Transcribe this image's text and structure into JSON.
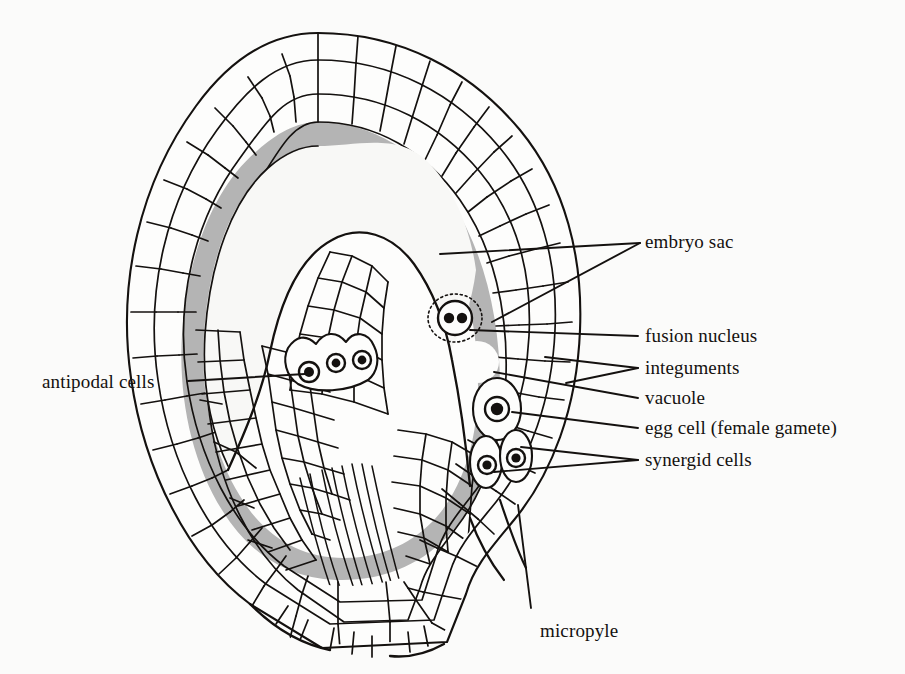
{
  "figure": {
    "background_color": "#fbfbfa",
    "ink_color": "#14110f",
    "cytoplasm_color": "#b4b4b4",
    "embryo_sac_fill": "#f7f7f5"
  },
  "labels": [
    {
      "id": "embryo-sac",
      "text": "embryo sac",
      "x": 645,
      "y": 240
    },
    {
      "id": "fusion-nucleus",
      "text": "fusion nucleus",
      "x": 645,
      "y": 327
    },
    {
      "id": "integuments",
      "text": "integuments",
      "x": 645,
      "y": 359
    },
    {
      "id": "vacuole",
      "text": "vacuole",
      "x": 645,
      "y": 389
    },
    {
      "id": "egg-cell",
      "text": "egg cell (female gamete)",
      "x": 645,
      "y": 419
    },
    {
      "id": "synergid-cells",
      "text": "synergid cells",
      "x": 645,
      "y": 451
    },
    {
      "id": "antipodal-cells",
      "text": "antipodal cells",
      "x": 42,
      "y": 386
    },
    {
      "id": "micropyle",
      "text": "micropyle",
      "x": 540,
      "y": 622
    }
  ],
  "leaders": [
    {
      "id": "embryo-sac-1",
      "from": [
        640,
        243
      ],
      "to": [
        440,
        254
      ]
    },
    {
      "id": "embryo-sac-2",
      "from": [
        640,
        243
      ],
      "to": [
        492,
        322
      ]
    },
    {
      "id": "fusion-nucleus-1",
      "from": [
        638,
        336
      ],
      "to": [
        470,
        330
      ]
    },
    {
      "id": "integuments-1",
      "from": [
        638,
        368
      ],
      "to": [
        545,
        357
      ]
    },
    {
      "id": "integuments-2",
      "from": [
        638,
        368
      ],
      "to": [
        566,
        383
      ]
    },
    {
      "id": "vacuole-1",
      "from": [
        638,
        398
      ],
      "to": [
        494,
        372
      ]
    },
    {
      "id": "egg-cell-1",
      "from": [
        638,
        428
      ],
      "to": [
        512,
        412
      ]
    },
    {
      "id": "synergid-1",
      "from": [
        638,
        460
      ],
      "to": [
        521,
        447
      ]
    },
    {
      "id": "synergid-2",
      "from": [
        638,
        460
      ],
      "to": [
        494,
        472
      ]
    },
    {
      "id": "antipodal-1",
      "from": [
        188,
        381
      ],
      "to": [
        305,
        374
      ]
    },
    {
      "id": "micropyle-1",
      "from": [
        531,
        608
      ],
      "to": [
        518,
        505
      ]
    }
  ],
  "structures": {
    "fusion_nucleus": {
      "cx": 455,
      "cy": 318,
      "r": 17,
      "nuclei": [
        [
          449,
          318
        ],
        [
          462,
          318
        ]
      ],
      "halo_r": 26
    },
    "vacuole": {
      "cx": 477,
      "cy": 362,
      "rx": 21,
      "ry": 20
    },
    "egg_cell": {
      "cx": 497,
      "cy": 409,
      "rx": 22,
      "ry": 29,
      "nucleus_r": 9
    },
    "synergid_cells": [
      {
        "cx": 487,
        "cy": 462,
        "rx": 15,
        "ry": 24,
        "nucleus_r": 7
      },
      {
        "cx": 515,
        "cy": 455,
        "rx": 15,
        "ry": 24,
        "nucleus_r": 7
      }
    ],
    "antipodal_cells": [
      {
        "cx": 309,
        "cy": 372,
        "r": 9
      },
      {
        "cx": 336,
        "cy": 363,
        "r": 8
      },
      {
        "cx": 362,
        "cy": 360,
        "r": 8
      }
    ]
  },
  "counts": {
    "antipodal_cells": 3,
    "synergid_cells": 2,
    "egg_cells": 1,
    "fusion_nucleus_nuclei": 2,
    "integument_layers": 2
  }
}
